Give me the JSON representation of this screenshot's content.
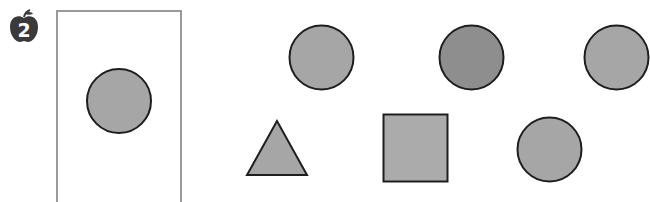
{
  "exercise": {
    "number": "2",
    "badge_icon": "apple-icon"
  },
  "colors": {
    "shape_fill": "#a6a6a6",
    "shape_fill_dark": "#8e8e8e",
    "square_fill": "#ababab",
    "outline": "#1e1e1e",
    "frame_border": "#9a9a9a",
    "badge_fill": "#3a3a3a"
  },
  "example_frame": {
    "shape": "circle",
    "shade": "light"
  },
  "options": [
    {
      "shape": "circle",
      "shade": "light",
      "row": 1,
      "col": 1
    },
    {
      "shape": "circle",
      "shade": "dark",
      "row": 1,
      "col": 2
    },
    {
      "shape": "circle",
      "shade": "light",
      "row": 1,
      "col": 3
    },
    {
      "shape": "triangle",
      "shade": "light",
      "row": 2,
      "col": 1
    },
    {
      "shape": "square",
      "shade": "light",
      "row": 2,
      "col": 2
    },
    {
      "shape": "circle",
      "shade": "light",
      "row": 2,
      "col": 3
    }
  ]
}
